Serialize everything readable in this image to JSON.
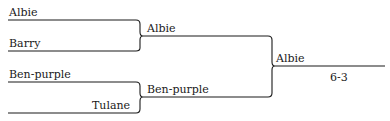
{
  "bracket": {
    "round1": [
      {
        "team": "Albie"
      },
      {
        "team": "Barry"
      },
      {
        "team": "Ben-purple"
      },
      {
        "team": "Tulane"
      }
    ],
    "round2": [
      {
        "team": "Albie"
      },
      {
        "team": "Ben-purple"
      }
    ],
    "final": {
      "team": "Albie",
      "score": "6-3"
    }
  }
}
